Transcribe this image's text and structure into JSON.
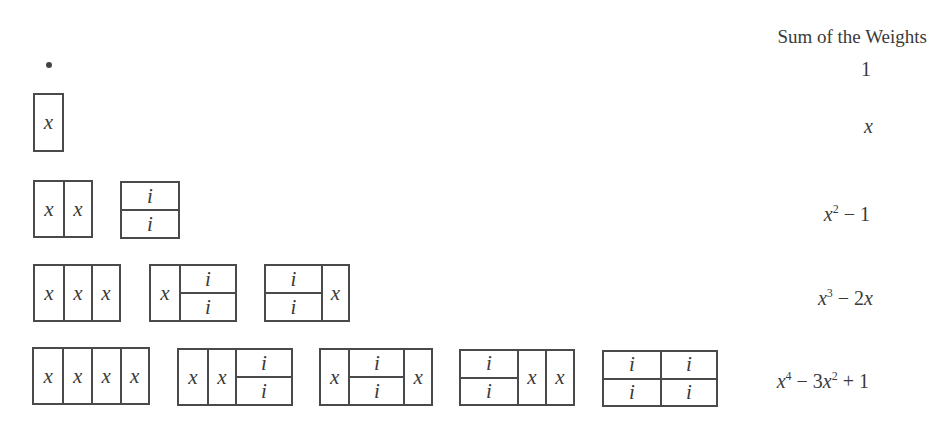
{
  "header": {
    "title": "Sum of the Weights"
  },
  "rows": [
    {
      "level": 0,
      "tilings": [],
      "weight": "1"
    },
    {
      "level": 1,
      "tilings": [
        [
          "x"
        ]
      ],
      "weight": "x"
    },
    {
      "level": 2,
      "tilings": [
        [
          "x",
          "x"
        ],
        [
          "ii"
        ]
      ],
      "weight": "x^2 − 1"
    },
    {
      "level": 3,
      "tilings": [
        [
          "x",
          "x",
          "x"
        ],
        [
          "x",
          "ii"
        ],
        [
          "ii",
          "x"
        ]
      ],
      "weight": "x^3 − 2x"
    },
    {
      "level": 4,
      "tilings": [
        [
          "x",
          "x",
          "x",
          "x"
        ],
        [
          "x",
          "x",
          "ii"
        ],
        [
          "x",
          "ii",
          "x"
        ],
        [
          "ii",
          "x",
          "x"
        ],
        [
          "ii",
          "ii"
        ]
      ],
      "weight": "x^4 − 3x^2 + 1"
    }
  ],
  "labels": {
    "x": "x",
    "i": "i"
  },
  "weights": {
    "w0": "1",
    "w1_base": "x",
    "w2_base": "x",
    "w2_exp": "2",
    "w2_rest": " − 1",
    "w3_base": "x",
    "w3_exp": "3",
    "w3_rest": " − 2",
    "w3_var": "x",
    "w4_base": "x",
    "w4_exp": "4",
    "w4_mid": " − 3",
    "w4_var": "x",
    "w4_exp2": "2",
    "w4_rest": " + 1"
  }
}
